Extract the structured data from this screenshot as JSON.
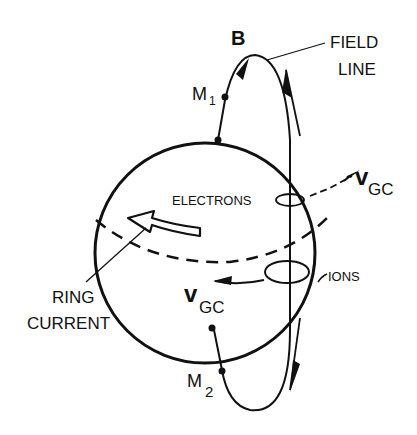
{
  "labels": {
    "b": "B",
    "field_line_1": "FIELD",
    "field_line_2": "LINE",
    "m1": "M",
    "m1_sub": "1",
    "m2": "M",
    "m2_sub": "2",
    "electrons": "ELECTRONS",
    "ions": "IONS",
    "vgc_upper": "v",
    "vgc_upper_sub": "GC",
    "vgc_lower": "v",
    "vgc_lower_sub": "GC",
    "ring_current_1": "RING",
    "ring_current_2": "CURRENT"
  },
  "colors": {
    "ink": "#111111",
    "background": "#ffffff"
  }
}
